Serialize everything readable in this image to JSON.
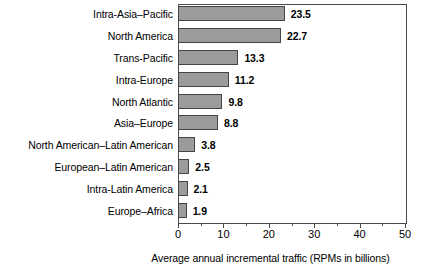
{
  "chart_data": {
    "type": "bar",
    "orientation": "horizontal",
    "title": "",
    "xlabel": "Average annual incremental traffic (RPMs in billions)",
    "ylabel": "",
    "xlim": [
      0,
      50
    ],
    "xticks": [
      0,
      10,
      20,
      30,
      40,
      50
    ],
    "xtick_labels": [
      "0",
      "10",
      "20",
      "30",
      "40",
      "50"
    ],
    "minor_tick_interval": 5,
    "grid": false,
    "legend": null,
    "bar_fill_color": "#9b9b9b",
    "bar_edge_color": "#454545",
    "axis_color": "#4a4a4a",
    "background_color": "#ffffff",
    "categories": [
      "Intra-Asia–Pacific",
      "North America",
      "Trans-Pacific",
      "Intra-Europe",
      "North Atlantic",
      "Asia–Europe",
      "North American–Latin American",
      "European–Latin American",
      "Intra-Latin America",
      "Europe–Africa"
    ],
    "values": [
      23.5,
      22.7,
      13.3,
      11.2,
      9.8,
      8.8,
      3.8,
      2.5,
      2.1,
      1.9
    ],
    "value_labels": [
      "23.5",
      "22.7",
      "13.3",
      "11.2",
      "9.8",
      "8.8",
      "3.8",
      "2.5",
      "2.1",
      "1.9"
    ]
  }
}
